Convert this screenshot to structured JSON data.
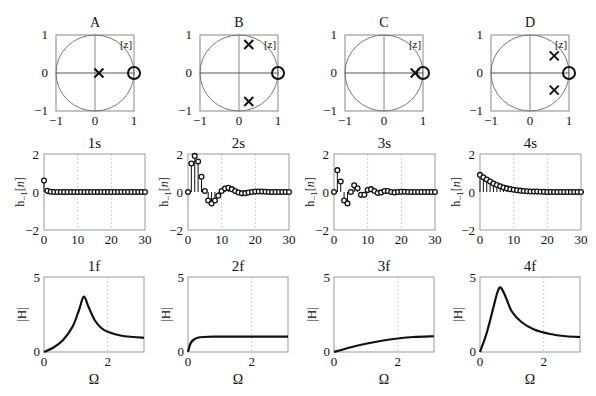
{
  "chart_data": [
    {
      "type": "scatter",
      "panel": "A",
      "title": "A",
      "kind": "pole-zero",
      "label": "[z]",
      "xlim": [
        -1,
        1
      ],
      "ylim": [
        -1,
        1
      ],
      "xticks": [
        "-1",
        "0",
        "1"
      ],
      "yticks": [
        "-1",
        "0",
        "1"
      ],
      "poles": [
        [
          0.1,
          0
        ]
      ],
      "zeros": [
        [
          1,
          0
        ]
      ]
    },
    {
      "type": "scatter",
      "panel": "B",
      "title": "B",
      "kind": "pole-zero",
      "label": "[z]",
      "xlim": [
        -1,
        1
      ],
      "ylim": [
        -1,
        1
      ],
      "xticks": [
        "-1",
        "0",
        "1"
      ],
      "yticks": [
        "-1",
        "0",
        "1"
      ],
      "poles": [
        [
          0.25,
          0.75
        ],
        [
          0.25,
          -0.75
        ]
      ],
      "zeros": [
        [
          1,
          0
        ]
      ]
    },
    {
      "type": "scatter",
      "panel": "C",
      "title": "C",
      "kind": "pole-zero",
      "label": "[z]",
      "xlim": [
        -1,
        1
      ],
      "ylim": [
        -1,
        1
      ],
      "xticks": [
        "-1",
        "0",
        "1"
      ],
      "yticks": [
        "-1",
        "0",
        "1"
      ],
      "poles": [
        [
          0.8,
          0
        ]
      ],
      "zeros": [
        [
          1,
          0
        ]
      ]
    },
    {
      "type": "scatter",
      "panel": "D",
      "title": "D",
      "kind": "pole-zero",
      "label": "[z]",
      "xlim": [
        -1,
        1
      ],
      "ylim": [
        -1,
        1
      ],
      "xticks": [
        "-1",
        "0",
        "1"
      ],
      "yticks": [
        "-1",
        "0",
        "1"
      ],
      "poles": [
        [
          0.62,
          0.45
        ],
        [
          0.62,
          -0.45
        ]
      ],
      "zeros": [
        [
          1,
          0
        ]
      ]
    },
    {
      "type": "stem",
      "panel": "1s",
      "title": "1s",
      "ylabel": "h_1[n]",
      "xlim": [
        0,
        30
      ],
      "ylim": [
        -2,
        2
      ],
      "xticks": [
        "0",
        "10",
        "20",
        "30"
      ],
      "yticks": [
        "-2",
        "0",
        "2"
      ],
      "x": [
        0,
        1,
        2,
        3,
        4,
        5,
        6,
        7,
        8,
        9,
        10,
        11,
        12,
        13,
        14,
        15,
        16,
        17,
        18,
        19,
        20,
        21,
        22,
        23,
        24,
        25,
        26,
        27,
        28,
        29,
        30
      ],
      "values": [
        0.6,
        0.06,
        0.01,
        0,
        0,
        0,
        0,
        0,
        0,
        0,
        0,
        0,
        0,
        0,
        0,
        0,
        0,
        0,
        0,
        0,
        0,
        0,
        0,
        0,
        0,
        0,
        0,
        0,
        0,
        0,
        0
      ]
    },
    {
      "type": "stem",
      "panel": "2s",
      "title": "2s",
      "ylabel": "h_1[n]",
      "xlim": [
        0,
        30
      ],
      "ylim": [
        -2,
        2
      ],
      "xticks": [
        "0",
        "10",
        "20",
        "30"
      ],
      "yticks": [
        "-2",
        "0",
        "2"
      ],
      "x": [
        0,
        1,
        2,
        3,
        4,
        5,
        6,
        7,
        8,
        9,
        10,
        11,
        12,
        13,
        14,
        15,
        16,
        17,
        18,
        19,
        20,
        21,
        22,
        23,
        24,
        25,
        26,
        27,
        28,
        29,
        30
      ],
      "values": [
        0,
        1.5,
        1.9,
        1.6,
        0.8,
        0.05,
        -0.45,
        -0.6,
        -0.45,
        -0.2,
        0.05,
        0.18,
        0.22,
        0.15,
        0.05,
        -0.03,
        -0.07,
        -0.06,
        -0.03,
        0,
        0.02,
        0.03,
        0.02,
        0.01,
        0,
        0,
        0,
        0,
        0,
        0,
        0
      ]
    },
    {
      "type": "stem",
      "panel": "3s",
      "title": "3s",
      "ylabel": "h_1[n]",
      "xlim": [
        0,
        30
      ],
      "ylim": [
        -2,
        2
      ],
      "xticks": [
        "0",
        "10",
        "20",
        "30"
      ],
      "yticks": [
        "-2",
        "0",
        "2"
      ],
      "x": [
        0,
        1,
        2,
        3,
        4,
        5,
        6,
        7,
        8,
        9,
        10,
        11,
        12,
        13,
        14,
        15,
        16,
        17,
        18,
        19,
        20,
        21,
        22,
        23,
        24,
        25,
        26,
        27,
        28,
        29,
        30
      ],
      "values": [
        0,
        1.15,
        0.55,
        -0.45,
        -0.6,
        0,
        0.35,
        0.2,
        -0.15,
        -0.15,
        0.1,
        0.15,
        0.05,
        -0.05,
        -0.02,
        0.05,
        0.05,
        0,
        -0.02,
        0,
        0.01,
        0.01,
        0,
        0,
        0,
        0,
        0,
        0,
        0,
        0,
        0
      ]
    },
    {
      "type": "stem",
      "panel": "4s",
      "title": "4s",
      "ylabel": "h_1[n]",
      "xlim": [
        0,
        30
      ],
      "ylim": [
        -2,
        2
      ],
      "xticks": [
        "0",
        "10",
        "20",
        "30"
      ],
      "yticks": [
        "-2",
        "0",
        "2"
      ],
      "x": [
        0,
        1,
        2,
        3,
        4,
        5,
        6,
        7,
        8,
        9,
        10,
        11,
        12,
        13,
        14,
        15,
        16,
        17,
        18,
        19,
        20,
        21,
        22,
        23,
        24,
        25,
        26,
        27,
        28,
        29,
        30
      ],
      "values": [
        0.9,
        0.78,
        0.66,
        0.55,
        0.45,
        0.37,
        0.3,
        0.24,
        0.19,
        0.15,
        0.12,
        0.09,
        0.07,
        0.05,
        0.04,
        0.03,
        0.02,
        0.02,
        0.01,
        0.01,
        0,
        0,
        0,
        0,
        0,
        0,
        0,
        0,
        0,
        0,
        0
      ]
    },
    {
      "type": "line",
      "panel": "1f",
      "title": "1f",
      "xlabel": "Ω",
      "ylabel": "|H|",
      "xlim": [
        0,
        3.14
      ],
      "ylim": [
        0,
        5
      ],
      "xticks": [
        "0",
        "2"
      ],
      "yticks": [
        "0",
        "5"
      ],
      "x": [
        0,
        0.3,
        0.6,
        0.9,
        1.1,
        1.25,
        1.4,
        1.6,
        1.8,
        2.0,
        2.4,
        2.8,
        3.14
      ],
      "values": [
        0,
        0.3,
        0.8,
        1.7,
        2.8,
        3.7,
        3.0,
        2.1,
        1.6,
        1.35,
        1.1,
        1.0,
        0.95
      ]
    },
    {
      "type": "line",
      "panel": "2f",
      "title": "2f",
      "xlabel": "Ω",
      "ylabel": "|H|",
      "xlim": [
        0,
        3.14
      ],
      "ylim": [
        0,
        5
      ],
      "xticks": [
        "0",
        "2"
      ],
      "yticks": [
        "0",
        "5"
      ],
      "x": [
        0,
        0.05,
        0.1,
        0.2,
        0.3,
        0.5,
        0.8,
        1.2,
        2.0,
        3.14
      ],
      "values": [
        0,
        0.4,
        0.65,
        0.85,
        0.95,
        1.0,
        1.02,
        1.02,
        1.02,
        1.02
      ]
    },
    {
      "type": "line",
      "panel": "3f",
      "title": "3f",
      "xlabel": "Ω",
      "ylabel": "|H|",
      "xlim": [
        0,
        3.14
      ],
      "ylim": [
        0,
        5
      ],
      "xticks": [
        "0",
        "2"
      ],
      "yticks": [
        "0",
        "5"
      ],
      "x": [
        0,
        0.5,
        1.0,
        1.5,
        2.0,
        2.5,
        3.14
      ],
      "values": [
        0,
        0.3,
        0.55,
        0.75,
        0.9,
        1.0,
        1.05
      ]
    },
    {
      "type": "line",
      "panel": "4f",
      "title": "4f",
      "xlabel": "Ω",
      "ylabel": "|H|",
      "xlim": [
        0,
        3.14
      ],
      "ylim": [
        0,
        5
      ],
      "xticks": [
        "0",
        "2"
      ],
      "yticks": [
        "0",
        "5"
      ],
      "x": [
        0,
        0.2,
        0.4,
        0.55,
        0.65,
        0.8,
        1.0,
        1.3,
        1.7,
        2.2,
        2.7,
        3.14
      ],
      "values": [
        0,
        1.2,
        2.8,
        4.0,
        4.3,
        3.7,
        2.7,
        2.0,
        1.5,
        1.2,
        1.05,
        1.0
      ]
    }
  ],
  "rows": {
    "pz": {
      "titles": [
        "A",
        "B",
        "C",
        "D"
      ],
      "label": "[z]"
    },
    "impulse": {
      "titles": [
        "1s",
        "2s",
        "3s",
        "4s"
      ],
      "ylabel": "h_1[n]"
    },
    "freq": {
      "titles": [
        "1f",
        "2f",
        "3f",
        "4f"
      ],
      "ylabel": "|H|",
      "xlabel": "Ω"
    }
  }
}
